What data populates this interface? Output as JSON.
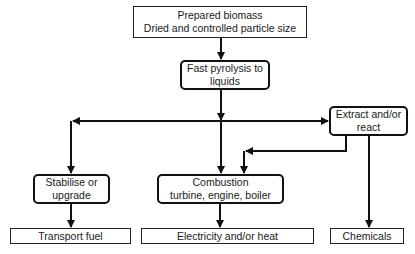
{
  "diagram": {
    "type": "flowchart",
    "nodes": {
      "prepared_biomass": {
        "line1": "Prepared biomass",
        "line2": "Dried and controlled particle size",
        "shape": "rectangle"
      },
      "fast_pyrolysis": {
        "line1": "Fast pyrolysis to",
        "line2": "liquids",
        "shape": "rounded"
      },
      "extract_react": {
        "line1": "Extract and/or",
        "line2": "react",
        "shape": "rounded"
      },
      "stabilise_upgrade": {
        "line1": "Stabilise or",
        "line2": "upgrade",
        "shape": "rounded"
      },
      "combustion": {
        "line1": "Combustion",
        "line2": "turbine, engine, boiler",
        "shape": "rounded"
      },
      "transport_fuel": {
        "line1": "Transport fuel",
        "shape": "rectangle"
      },
      "electricity_heat": {
        "line1": "Electricity and/or heat",
        "shape": "rectangle"
      },
      "chemicals": {
        "line1": "Chemicals",
        "shape": "rectangle"
      }
    },
    "edges": [
      {
        "from": "Prepared biomass",
        "to": "Fast pyrolysis to liquids"
      },
      {
        "from": "Fast pyrolysis to liquids",
        "to": "Stabilise or upgrade"
      },
      {
        "from": "Fast pyrolysis to liquids",
        "to": "Combustion"
      },
      {
        "from": "Fast pyrolysis to liquids",
        "to": "Extract and/or react"
      },
      {
        "from": "Extract and/or react",
        "to": "Combustion"
      },
      {
        "from": "Extract and/or react",
        "to": "Chemicals"
      },
      {
        "from": "Stabilise or upgrade",
        "to": "Transport fuel"
      },
      {
        "from": "Combustion",
        "to": "Electricity and/or heat"
      }
    ],
    "colors": {
      "line": "#111111",
      "background": "#ffffff"
    }
  }
}
